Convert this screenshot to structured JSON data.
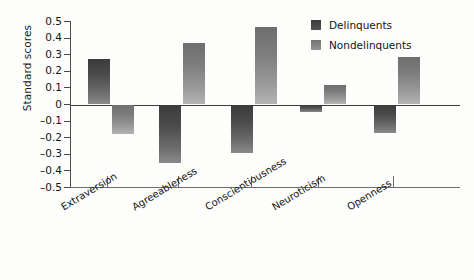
{
  "chart_data": {
    "type": "bar",
    "title": "",
    "xlabel": "",
    "ylabel": "Standard scores",
    "ylim": [
      -0.5,
      0.5
    ],
    "yticks": [
      0.5,
      0.4,
      0.3,
      0.2,
      0.1,
      0,
      -0.1,
      -0.2,
      -0.3,
      -0.4,
      -0.5
    ],
    "ytick_labels": [
      "0.5",
      "0.4",
      "0.3",
      "0.2",
      "0.1",
      "0",
      "–0.1",
      "–0.2",
      "–0.3",
      "–0.4",
      "–0.5"
    ],
    "grid": false,
    "legend_position": "top-right",
    "categories": [
      "Extraversion",
      "Agreeableness",
      "Conscientiousness",
      "Neuroticism",
      "Openness"
    ],
    "series": [
      {
        "name": "Delinquents",
        "color": "#3b3b3b",
        "values": [
          0.275,
          -0.355,
          -0.295,
          -0.045,
          -0.17
        ]
      },
      {
        "name": "Nondelinquents",
        "color": "#8a8a8a",
        "values": [
          -0.18,
          0.37,
          0.465,
          0.115,
          0.285
        ]
      }
    ]
  },
  "legend": {
    "items": [
      {
        "label": "Delinquents"
      },
      {
        "label": "Nondelinquents"
      }
    ]
  },
  "axis": {
    "y_title": "Standard scores"
  }
}
